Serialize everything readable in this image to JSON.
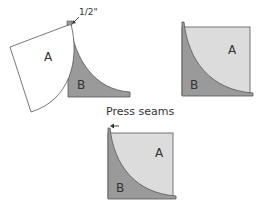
{
  "colors": {
    "piece_a_fill_flat": "#ffffff",
    "piece_a_fill_pressed": "#dcdcdc",
    "piece_b_fill": "#9a9a9a",
    "outline": "#555555",
    "text": "#333333"
  },
  "step1": {
    "label_a": "A",
    "label_b": "B",
    "seam_allowance": "1/2\""
  },
  "step2": {
    "label_a": "A",
    "label_b": "B"
  },
  "step3": {
    "title": "Press seams",
    "label_a": "A",
    "label_b": "B"
  },
  "icons": [
    "arrow-left-icon",
    "seam-marker-icon"
  ]
}
